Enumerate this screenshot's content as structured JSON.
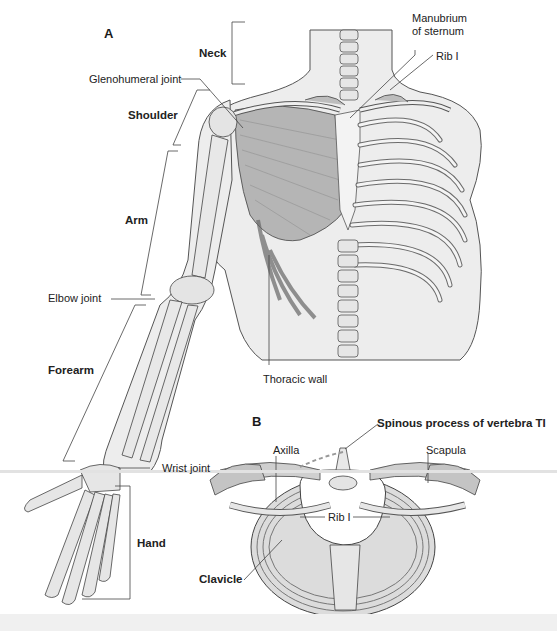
{
  "figure": {
    "panels": [
      {
        "id": "A",
        "label": "A",
        "region_labels": [
          "Neck",
          "Shoulder",
          "Arm",
          "Forearm",
          "Hand"
        ],
        "structure_labels": [
          "Glenohumeral joint",
          "Manubrium of sternum",
          "Rib I",
          "Elbow joint",
          "Thoracic wall",
          "Wrist joint"
        ]
      },
      {
        "id": "B",
        "label": "B",
        "structure_labels": [
          "Spinous process of vertebra TI",
          "Axilla",
          "Scapula",
          "Rib I",
          "Clavicle"
        ]
      }
    ],
    "labels": {
      "panel_a": "A",
      "panel_b": "B",
      "neck": "Neck",
      "glenohumeral_joint": "Glenohumeral joint",
      "shoulder": "Shoulder",
      "arm": "Arm",
      "elbow_joint": "Elbow joint",
      "forearm": "Forearm",
      "wrist_joint": "Wrist joint",
      "hand": "Hand",
      "manubrium_line1": "Manubrium",
      "manubrium_line2": "of sternum",
      "rib_i_a": "Rib I",
      "thoracic_wall": "Thoracic wall",
      "spinous_process": "Spinous process of vertebra TI",
      "axilla": "Axilla",
      "scapula": "Scapula",
      "rib_i_b": "Rib I",
      "clavicle": "Clavicle"
    },
    "colors": {
      "skin": "#ececec",
      "outline": "#3a3a3a",
      "bone": "#dcdcdc",
      "muscle": "#a9a9a9",
      "leader": "#444444"
    }
  }
}
